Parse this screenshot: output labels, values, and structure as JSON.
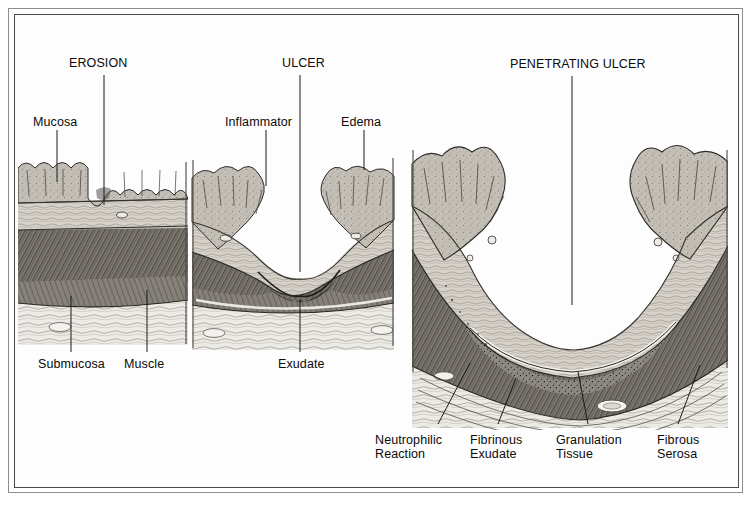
{
  "figure": {
    "kind": "medical-illustration",
    "background_color": "#fdfdfd",
    "ink_color": "#0b0b0b",
    "frame_color_outer": "#8d8d8d",
    "frame_color_inner": "#4a4a4a"
  },
  "panels": [
    {
      "id": "erosion",
      "title": "EROSION",
      "title_x": 69,
      "title_y": 56,
      "leader": {
        "x1": 104,
        "y1": 75,
        "x2": 104,
        "y2": 205
      }
    },
    {
      "id": "ulcer",
      "title": "ULCER",
      "title_x": 282,
      "title_y": 56,
      "leader": {
        "x1": 300,
        "y1": 75,
        "x2": 300,
        "y2": 272
      }
    },
    {
      "id": "penetrating-ulcer",
      "title": "PENETRATING ULCER",
      "title_x": 510,
      "title_y": 57,
      "leader": {
        "x1": 572,
        "y1": 76,
        "x2": 572,
        "y2": 305
      }
    }
  ],
  "callouts": [
    {
      "id": "mucosa",
      "text": "Mucosa",
      "text_x": 33,
      "text_y": 115,
      "align": "left",
      "leader": {
        "x1": 57,
        "y1": 130,
        "x2": 57,
        "y2": 182
      }
    },
    {
      "id": "inflammator",
      "text": "Inflammator",
      "text_x": 225,
      "text_y": 115,
      "align": "left",
      "leader": {
        "x1": 266,
        "y1": 130,
        "x2": 266,
        "y2": 186
      }
    },
    {
      "id": "edema",
      "text": "Edema",
      "text_x": 341,
      "text_y": 115,
      "align": "left",
      "leader": {
        "x1": 364,
        "y1": 130,
        "x2": 364,
        "y2": 170
      }
    },
    {
      "id": "submucosa",
      "text": "Submucosa",
      "text_x": 38,
      "text_y": 357,
      "align": "left",
      "leader": {
        "x1": 71,
        "y1": 296,
        "x2": 71,
        "y2": 352
      }
    },
    {
      "id": "muscle",
      "text": "Muscle",
      "text_x": 124,
      "text_y": 357,
      "align": "left",
      "leader": {
        "x1": 147,
        "y1": 290,
        "x2": 147,
        "y2": 352
      }
    },
    {
      "id": "exudate",
      "text": "Exudate",
      "text_x": 278,
      "text_y": 357,
      "align": "left",
      "leader": {
        "x1": 300,
        "y1": 300,
        "x2": 300,
        "y2": 352
      }
    }
  ],
  "callouts_two_line": [
    {
      "id": "neutrophilic-reaction",
      "line1": "Neutrophilic",
      "line2": "Reaction",
      "text_x": 375,
      "text_y": 434,
      "align": "left",
      "leader": {
        "x1": 438,
        "y1": 424,
        "x2": 470,
        "y2": 363
      }
    },
    {
      "id": "fibrinous-exudate",
      "line1": "Fibrinous",
      "line2": "Exudate",
      "text_x": 470,
      "text_y": 434,
      "align": "left",
      "leader": {
        "x1": 498,
        "y1": 424,
        "x2": 516,
        "y2": 378
      }
    },
    {
      "id": "granulation-tissue",
      "line1": "Granulation",
      "line2": "Tissue",
      "text_x": 556,
      "text_y": 434,
      "align": "left",
      "leader": {
        "x1": 588,
        "y1": 424,
        "x2": 578,
        "y2": 372
      }
    },
    {
      "id": "fibrous-serosa",
      "line1": "Fibrous",
      "line2": "Serosa",
      "text_x": 657,
      "text_y": 434,
      "align": "left",
      "leader": {
        "x1": 678,
        "y1": 424,
        "x2": 700,
        "y2": 365
      }
    }
  ],
  "tissue_layers": [
    {
      "name": "mucosa",
      "tone": "#b9b5ad"
    },
    {
      "name": "submucosa",
      "tone": "#cfcbc3"
    },
    {
      "name": "muscularis",
      "tone": "#6f6b64"
    },
    {
      "name": "serosa",
      "tone": "#e8e5df"
    }
  ]
}
